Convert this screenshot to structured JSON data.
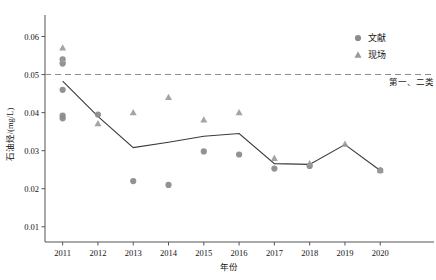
{
  "chart_data": {
    "type": "scatter",
    "title": "",
    "xlabel": "年份",
    "ylabel": "石油烃/(mg/L)",
    "xlim": [
      2010.5,
      2020.9
    ],
    "ylim": [
      0.006,
      0.0625
    ],
    "xticks": [
      "2011",
      "2012",
      "2013",
      "2014",
      "2015",
      "2016",
      "2017",
      "2018",
      "2019",
      "2020"
    ],
    "yticks": [
      "0.01",
      "0.02",
      "0.03",
      "0.04",
      "0.05",
      "0.06"
    ],
    "ytick_values": [
      0.01,
      0.02,
      0.03,
      0.04,
      0.05,
      0.06
    ],
    "grid": false,
    "legend_position": "top-right",
    "legend": [
      {
        "label": "文献",
        "marker": "circle",
        "color": "#8c8c8c"
      },
      {
        "label": "现场",
        "marker": "triangle",
        "color": "#9a9a9a"
      }
    ],
    "annotations": [
      {
        "text": "第一、二类",
        "x": 2020.2,
        "y": 0.0472
      }
    ],
    "threshold": {
      "label": "第一、二类",
      "value": 0.05,
      "style": "dashed",
      "color": "#8c8c8c"
    },
    "series": [
      {
        "name": "文献",
        "marker": "circle",
        "color": "#8c8c8c",
        "points": [
          {
            "x": 2011,
            "y": 0.054
          },
          {
            "x": 2011,
            "y": 0.0529
          },
          {
            "x": 2011,
            "y": 0.046
          },
          {
            "x": 2011,
            "y": 0.0392
          },
          {
            "x": 2011,
            "y": 0.0385
          },
          {
            "x": 2012,
            "y": 0.0395
          },
          {
            "x": 2013,
            "y": 0.022
          },
          {
            "x": 2014,
            "y": 0.021
          },
          {
            "x": 2015,
            "y": 0.0298
          },
          {
            "x": 2016,
            "y": 0.029
          },
          {
            "x": 2017,
            "y": 0.0253
          },
          {
            "x": 2018,
            "y": 0.026
          },
          {
            "x": 2020,
            "y": 0.0248
          }
        ]
      },
      {
        "name": "现场",
        "marker": "triangle",
        "color": "#9a9a9a",
        "points": [
          {
            "x": 2011,
            "y": 0.057
          },
          {
            "x": 2011,
            "y": 0.0537
          },
          {
            "x": 2012,
            "y": 0.0371
          },
          {
            "x": 2013,
            "y": 0.04
          },
          {
            "x": 2014,
            "y": 0.044
          },
          {
            "x": 2015,
            "y": 0.0381
          },
          {
            "x": 2016,
            "y": 0.04
          },
          {
            "x": 2017,
            "y": 0.028
          },
          {
            "x": 2018,
            "y": 0.0266
          },
          {
            "x": 2019,
            "y": 0.0317
          },
          {
            "x": 2020,
            "y": 0.0248
          }
        ]
      },
      {
        "name": "趋势线",
        "marker": "none",
        "color": "#3a3a3a",
        "points": [
          {
            "x": 2011,
            "y": 0.0483
          },
          {
            "x": 2012,
            "y": 0.039
          },
          {
            "x": 2013,
            "y": 0.0308
          },
          {
            "x": 2014,
            "y": 0.0322
          },
          {
            "x": 2015,
            "y": 0.0338
          },
          {
            "x": 2016,
            "y": 0.0345
          },
          {
            "x": 2017,
            "y": 0.0266
          },
          {
            "x": 2018,
            "y": 0.0264
          },
          {
            "x": 2019,
            "y": 0.0316
          },
          {
            "x": 2020,
            "y": 0.0248
          }
        ]
      }
    ]
  }
}
